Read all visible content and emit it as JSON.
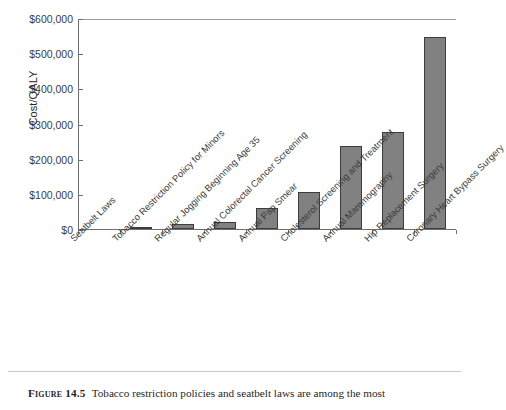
{
  "figure": {
    "caption_label": "Figure 14.5",
    "caption_text": "Tobacco restriction policies and seatbelt laws are among the most"
  },
  "chart_data": {
    "type": "bar",
    "title": "",
    "xlabel": "",
    "ylabel": "Cost/QALY",
    "ylim": [
      0,
      600000
    ],
    "ytick_values": [
      0,
      100000,
      200000,
      300000,
      400000,
      500000,
      600000
    ],
    "ytick_labels": [
      "$0",
      "$100,000",
      "$200,000",
      "$300,000",
      "$400,000",
      "$500,000",
      "$600,000"
    ],
    "grid": false,
    "legend": false,
    "bar_color": "#818181",
    "bar_edge_color": "#3c3c3c",
    "axis_color": "#6f6f6f",
    "categories": [
      "Seatbelt Laws",
      "Tobacco Restriction Policy for Minors",
      "Regular Jogging Beginning Age 35",
      "Annual Colorectal Cancer Screening",
      "Annual Pap Smear",
      "Cholesterol Screening and Treatment",
      "Annual Mammography",
      "Hip Replacement Surgery",
      "Coronary Heart Bypass Surgery"
    ],
    "values": [
      0,
      3000,
      14000,
      19000,
      60000,
      105000,
      236000,
      276000,
      545000
    ]
  }
}
